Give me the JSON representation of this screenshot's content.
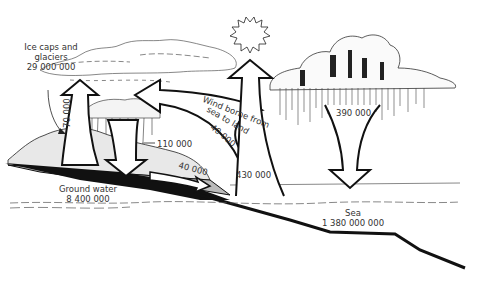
{
  "diagram": {
    "type": "water-cycle",
    "labels": {
      "ice_caps_line1": "Ice caps and",
      "ice_caps_line2": "glaciers",
      "ice_caps_value": "29 000 000",
      "evap_land_value": "70 000",
      "precip_land_value": "110 000",
      "wind_line1": "Wind borne from",
      "wind_line2": "sea to land",
      "wind_value": "40 000",
      "runoff_value": "40 000",
      "evap_sea_value": "430 000",
      "precip_sea_value": "390 000",
      "groundwater_line1": "Ground water",
      "groundwater_value": "8 400 000",
      "sea_line1": "Sea",
      "sea_value": "1 380 000 000"
    },
    "icons": [
      "sun-icon",
      "cloud-icon",
      "up-arrow-icon",
      "down-arrow-icon",
      "curved-arrow-icon"
    ],
    "colors": {
      "ink": "#111111",
      "text": "#333333",
      "background": "#ffffff"
    }
  }
}
